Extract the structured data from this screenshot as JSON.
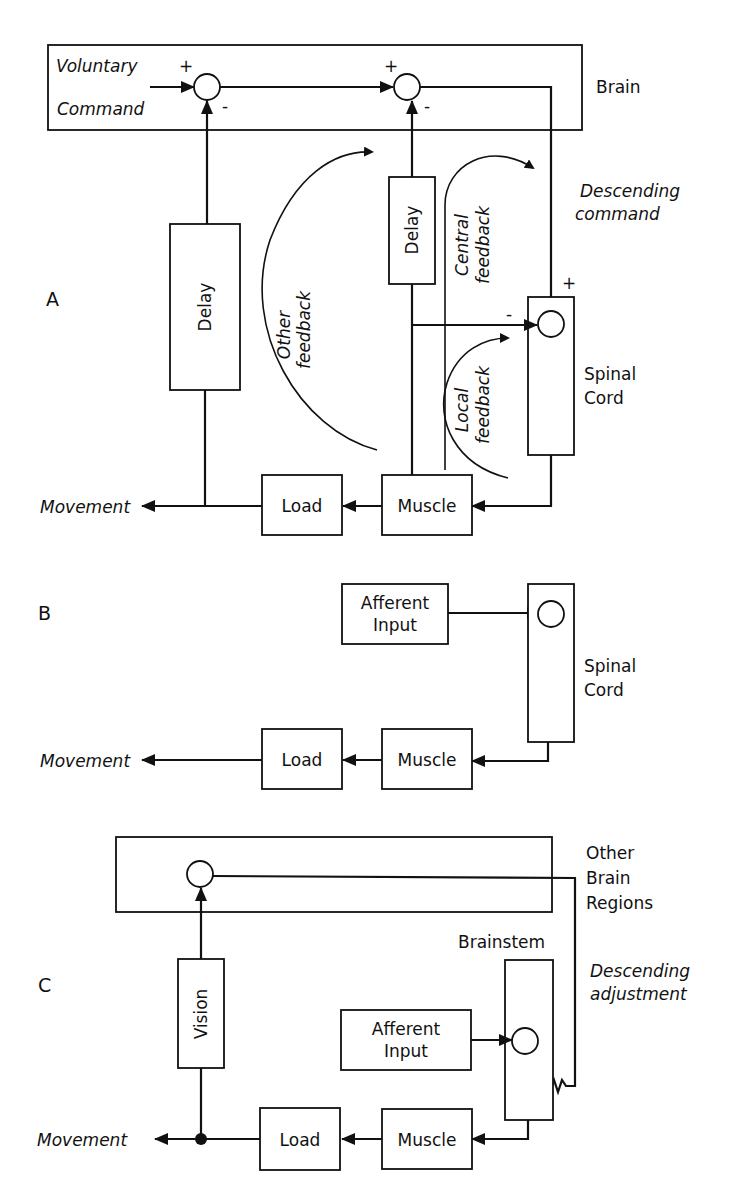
{
  "panels": {
    "a": {
      "label": "A",
      "region_brain": "Brain",
      "input_line1": "Voluntary",
      "input_line2": "Command",
      "sum1_plus": "+",
      "sum1_minus": "-",
      "sum2_plus": "+",
      "sum2_minus": "-",
      "sum3_plus": "+",
      "sum3_minus": "-",
      "delay_left": "Delay",
      "delay_mid": "Delay",
      "other_feedback_line1": "Other",
      "other_feedback_line2": "feedback",
      "central_feedback_line1": "Central",
      "central_feedback_line2": "feedback",
      "local_feedback_line1": "Local",
      "local_feedback_line2": "feedback",
      "descending_line1": "Descending",
      "descending_line2": "command",
      "spinal_line1": "Spinal",
      "spinal_line2": "Cord",
      "load": "Load",
      "muscle": "Muscle",
      "output": "Movement"
    },
    "b": {
      "label": "B",
      "afferent_line1": "Afferent",
      "afferent_line2": "Input",
      "spinal_line1": "Spinal",
      "spinal_line2": "Cord",
      "load": "Load",
      "muscle": "Muscle",
      "output": "Movement"
    },
    "c": {
      "label": "C",
      "other_brain_line1": "Other",
      "other_brain_line2": "Brain",
      "other_brain_line3": "Regions",
      "brainstem": "Brainstem",
      "descending_line1": "Descending",
      "descending_line2": "adjustment",
      "vision": "Vision",
      "afferent_line1": "Afferent",
      "afferent_line2": "Input",
      "load": "Load",
      "muscle": "Muscle",
      "output": "Movement"
    }
  }
}
